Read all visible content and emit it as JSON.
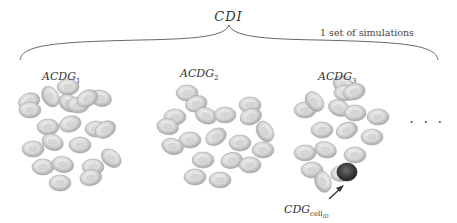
{
  "figure": {
    "title": "CDI",
    "note": "1 set of simulations",
    "clusters": [
      {
        "label_main": "ACDG",
        "label_sub": "1"
      },
      {
        "label_main": "ACDG",
        "label_sub": "2"
      },
      {
        "label_main": "ACDG",
        "label_sub": "3"
      }
    ],
    "highlight": {
      "label_main": "CDG",
      "label_sub": "cell",
      "label_subsub": "ID"
    },
    "ellipsis": "· · ·",
    "colors": {
      "cell": "#e6e6e6",
      "cell_shadow": "#b9b9b9",
      "highlight_cell": "#3a3a3a",
      "brace": "#555555"
    }
  }
}
